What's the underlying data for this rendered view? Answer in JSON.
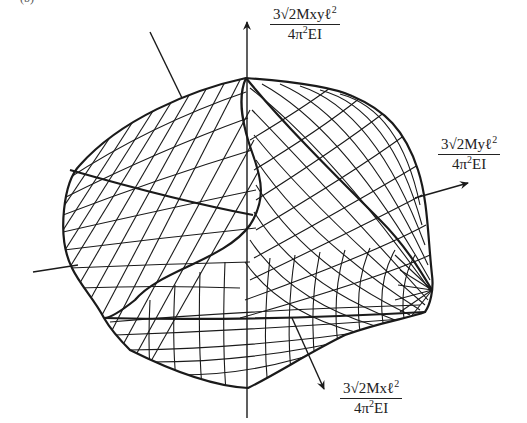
{
  "figure": {
    "corner_label": "(b)",
    "axes": {
      "vertical": {
        "num_prefix": "3√2Mxyℓ",
        "num_exp": "2",
        "den_prefix": "4π",
        "den_exp": "2",
        "den_suffix": "EI"
      },
      "right": {
        "num_prefix": "3√2Myℓ",
        "num_exp": "2",
        "den_prefix": "4π",
        "den_exp": "2",
        "den_suffix": "EI"
      },
      "down_right": {
        "num_prefix": "3√2Mxℓ",
        "num_exp": "2",
        "den_prefix": "4π",
        "den_exp": "2",
        "den_suffix": "EI"
      }
    },
    "colors": {
      "ink": "#1a1a1a",
      "background": "#ffffff"
    }
  }
}
